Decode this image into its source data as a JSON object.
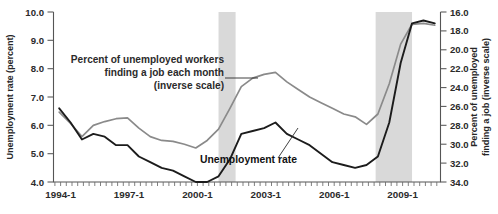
{
  "chart_data": {
    "type": "line",
    "title": "",
    "xlabel": "",
    "ylabel": "Unemployment rate (percent)",
    "y2label": "Percent of unemployed finding a job (inverse scale)",
    "ylim": [
      4.0,
      10.0
    ],
    "y2lim": [
      34.0,
      16.0
    ],
    "y_ticks": [
      "4.0",
      "5.0",
      "6.0",
      "7.0",
      "8.0",
      "9.0",
      "10.0"
    ],
    "y2_ticks": [
      "16.0",
      "18.0",
      "20.0",
      "22.0",
      "24.0",
      "26.0",
      "28.0",
      "30.0",
      "32.0",
      "34.0"
    ],
    "x_ticks": [
      "1994-1",
      "1997-1",
      "2000-1",
      "2003-1",
      "2006-1",
      "2009-1"
    ],
    "x_tick_values": [
      1994.0,
      1997.0,
      2000.0,
      2003.0,
      2006.0,
      2009.0
    ],
    "xlim": [
      1993.75,
      2010.75
    ],
    "grid": false,
    "legend_position": "inline-annotation",
    "annotations": [
      {
        "name": "job-finding-label",
        "lines": [
          "Percent of unemployed workers",
          "finding a job each month",
          "(inverse scale)"
        ]
      },
      {
        "name": "unemployment-rate-label",
        "lines": [
          "Unemployment rate"
        ]
      }
    ],
    "shaded_regions": [
      {
        "name": "recession-2001",
        "x_start": 2001.0,
        "x_end": 2001.75
      },
      {
        "name": "recession-2007-2009",
        "x_start": 2007.9,
        "x_end": 2009.5
      }
    ],
    "series": [
      {
        "name": "Unemployment rate",
        "axis": "left",
        "units": "percent",
        "color": "#1c1c1c",
        "x": [
          1994.0,
          1994.5,
          1995.0,
          1995.5,
          1996.0,
          1996.5,
          1997.0,
          1997.5,
          1998.0,
          1998.5,
          1999.0,
          1999.5,
          2000.0,
          2000.5,
          2001.0,
          2001.5,
          2002.0,
          2002.5,
          2003.0,
          2003.5,
          2004.0,
          2004.5,
          2005.0,
          2005.5,
          2006.0,
          2006.5,
          2007.0,
          2007.5,
          2008.0,
          2008.5,
          2009.0,
          2009.5,
          2010.0,
          2010.5
        ],
        "values": [
          6.6,
          6.1,
          5.5,
          5.7,
          5.6,
          5.3,
          5.3,
          4.9,
          4.7,
          4.5,
          4.4,
          4.2,
          4.0,
          4.0,
          4.2,
          4.8,
          5.7,
          5.8,
          5.9,
          6.1,
          5.7,
          5.5,
          5.3,
          5.0,
          4.7,
          4.6,
          4.5,
          4.6,
          4.9,
          6.1,
          8.2,
          9.6,
          9.7,
          9.6
        ]
      },
      {
        "name": "Percent of unemployed workers finding a job each month",
        "axis": "right",
        "units": "percent",
        "inverse_scale": true,
        "color": "#8a8a8a",
        "x": [
          1994.0,
          1994.5,
          1995.0,
          1995.5,
          1996.0,
          1996.5,
          1997.0,
          1997.5,
          1998.0,
          1998.5,
          1999.0,
          1999.5,
          2000.0,
          2000.5,
          2001.0,
          2001.5,
          2002.0,
          2002.5,
          2003.0,
          2003.5,
          2004.0,
          2004.5,
          2005.0,
          2005.5,
          2006.0,
          2006.5,
          2007.0,
          2007.5,
          2008.0,
          2008.5,
          2009.0,
          2009.5,
          2010.0,
          2010.5
        ],
        "values": [
          26.6,
          27.8,
          29.2,
          28.0,
          27.6,
          27.3,
          27.2,
          28.3,
          29.2,
          29.6,
          29.7,
          30.0,
          30.4,
          29.6,
          28.4,
          26.2,
          23.9,
          23.0,
          22.6,
          22.4,
          23.4,
          24.2,
          25.0,
          25.6,
          26.2,
          26.8,
          27.1,
          27.9,
          26.8,
          23.6,
          19.4,
          17.3,
          17.2,
          17.4
        ]
      }
    ]
  }
}
